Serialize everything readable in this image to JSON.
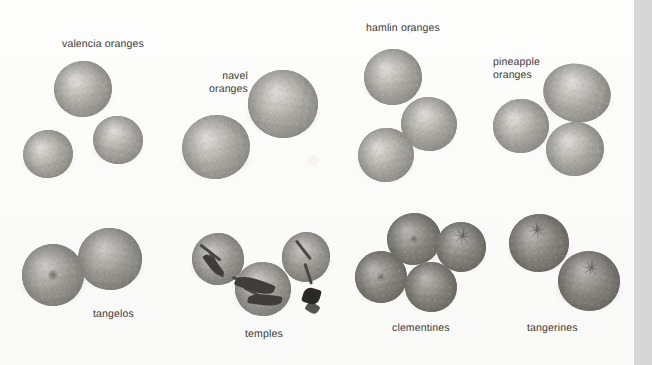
{
  "plate": {
    "title": "citrus varieties photographic plate",
    "background_color": "#fdfdfc",
    "width": 652,
    "height": 365,
    "right_strip_color": "#d7d7d7"
  },
  "labels": [
    {
      "id": "valencia",
      "text": "valencia oranges",
      "x": 62,
      "y": 38,
      "align": "left"
    },
    {
      "id": "navel",
      "text": "navel\noranges",
      "x": 170,
      "y": 70,
      "align": "right",
      "width": 78
    },
    {
      "id": "hamlin",
      "text": "hamlin oranges",
      "x": 366,
      "y": 22,
      "align": "left"
    },
    {
      "id": "pineapple",
      "text": "pineapple\noranges",
      "x": 493,
      "y": 56,
      "align": "left"
    },
    {
      "id": "tangelos",
      "text": "tangelos",
      "x": 93,
      "y": 308,
      "align": "left"
    },
    {
      "id": "temples",
      "text": "temples",
      "x": 245,
      "y": 328,
      "align": "left"
    },
    {
      "id": "clementines",
      "text": "clementines",
      "x": 392,
      "y": 322,
      "align": "left"
    },
    {
      "id": "tangerines",
      "text": "tangerines",
      "x": 527,
      "y": 322,
      "align": "left"
    }
  ],
  "groups": [
    {
      "id": "valencia-oranges",
      "name": "valencia oranges",
      "count": 3,
      "fruit": [
        {
          "cx": 83,
          "cy": 89,
          "rx": 29,
          "ry": 28,
          "tone": "light",
          "rot": -6
        },
        {
          "cx": 118,
          "cy": 140,
          "rx": 25,
          "ry": 24,
          "tone": "light",
          "rot": 12
        },
        {
          "cx": 48,
          "cy": 154,
          "rx": 25,
          "ry": 24,
          "tone": "light",
          "rot": -14
        }
      ]
    },
    {
      "id": "navel-oranges",
      "name": "navel oranges",
      "count": 2,
      "fruit": [
        {
          "cx": 283,
          "cy": 104,
          "rx": 35,
          "ry": 34,
          "tone": "light",
          "rot": 8
        },
        {
          "cx": 216,
          "cy": 147,
          "rx": 34,
          "ry": 32,
          "tone": "light",
          "rot": -10
        }
      ]
    },
    {
      "id": "hamlin-oranges",
      "name": "hamlin oranges",
      "count": 3,
      "fruit": [
        {
          "cx": 393,
          "cy": 77,
          "rx": 29,
          "ry": 28,
          "tone": "light",
          "rot": -5
        },
        {
          "cx": 429,
          "cy": 124,
          "rx": 28,
          "ry": 27,
          "tone": "light",
          "rot": 10
        },
        {
          "cx": 386,
          "cy": 155,
          "rx": 28,
          "ry": 27,
          "tone": "light",
          "rot": -12
        }
      ]
    },
    {
      "id": "pineapple-oranges",
      "name": "pineapple oranges",
      "count": 3,
      "fruit": [
        {
          "cx": 521,
          "cy": 126,
          "rx": 28,
          "ry": 27,
          "tone": "light",
          "rot": -8
        },
        {
          "cx": 577,
          "cy": 93,
          "rx": 34,
          "ry": 29,
          "tone": "light",
          "rot": 14
        },
        {
          "cx": 575,
          "cy": 149,
          "rx": 29,
          "ry": 27,
          "tone": "light",
          "rot": -4
        }
      ]
    },
    {
      "id": "tangelos",
      "name": "tangelos",
      "count": 2,
      "fruit": [
        {
          "cx": 53,
          "cy": 275,
          "rx": 31,
          "ry": 31,
          "tone": "mid",
          "rot": -8,
          "navel": true
        },
        {
          "cx": 110,
          "cy": 259,
          "rx": 32,
          "ry": 31,
          "tone": "mid",
          "rot": 7
        }
      ]
    },
    {
      "id": "temples",
      "name": "temples",
      "count": 3,
      "has_stems": true,
      "fruit": [
        {
          "cx": 218,
          "cy": 259,
          "rx": 26,
          "ry": 26,
          "tone": "mid",
          "rot": -10
        },
        {
          "cx": 263,
          "cy": 289,
          "rx": 28,
          "ry": 27,
          "tone": "mid",
          "rot": 6
        },
        {
          "cx": 306,
          "cy": 257,
          "rx": 24,
          "ry": 25,
          "tone": "mid",
          "rot": 12
        }
      ]
    },
    {
      "id": "clementines",
      "name": "clementines",
      "count": 4,
      "fruit": [
        {
          "cx": 414,
          "cy": 239,
          "rx": 27,
          "ry": 26,
          "tone": "dark",
          "rot": -6,
          "navel": true
        },
        {
          "cx": 461,
          "cy": 247,
          "rx": 25,
          "ry": 25,
          "tone": "dark",
          "rot": 9,
          "star": true
        },
        {
          "cx": 381,
          "cy": 277,
          "rx": 26,
          "ry": 26,
          "tone": "dark",
          "rot": -12,
          "navel": true
        },
        {
          "cx": 431,
          "cy": 287,
          "rx": 26,
          "ry": 25,
          "tone": "dark",
          "rot": 4
        }
      ]
    },
    {
      "id": "tangerines",
      "name": "tangerines",
      "count": 2,
      "fruit": [
        {
          "cx": 539,
          "cy": 243,
          "rx": 30,
          "ry": 29,
          "tone": "dark",
          "rot": -7,
          "star": true
        },
        {
          "cx": 589,
          "cy": 281,
          "rx": 31,
          "ry": 30,
          "tone": "dark",
          "rot": 10,
          "star": true
        }
      ]
    }
  ]
}
